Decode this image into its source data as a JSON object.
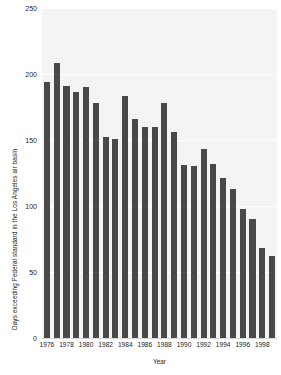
{
  "chart_data": {
    "type": "bar",
    "title": "",
    "xlabel": "Year",
    "ylabel": "Days exceeding Federal standard in the Los Angeles air basin",
    "ylim": [
      0,
      250
    ],
    "yticks": [
      0,
      50,
      100,
      150,
      200,
      250
    ],
    "ytick_labels": [
      "0",
      "50",
      "100",
      "150",
      "200",
      "250"
    ],
    "xticks": [
      1976,
      1978,
      1980,
      1982,
      1984,
      1986,
      1988,
      1990,
      1992,
      1994,
      1996,
      1998
    ],
    "xtick_labels": [
      "1976",
      "1978",
      "1980",
      "1982",
      "1984",
      "1986",
      "1988",
      "1990",
      "1992",
      "1994",
      "1996",
      "1998"
    ],
    "grid": "horizontal-white-on-gray",
    "legend": "none",
    "bar_color": "#494949",
    "plot_background": "#f4f4f4",
    "categories": [
      "1976",
      "1977",
      "1978",
      "1979",
      "1980",
      "1981",
      "1982",
      "1983",
      "1984",
      "1985",
      "1986",
      "1987",
      "1988",
      "1989",
      "1990",
      "1991",
      "1992",
      "1993",
      "1994",
      "1995",
      "1996",
      "1997",
      "1998",
      "1999"
    ],
    "values": [
      194,
      208,
      191,
      186,
      190,
      178,
      152,
      151,
      183,
      166,
      160,
      160,
      178,
      156,
      131,
      130,
      143,
      132,
      121,
      113,
      98,
      90,
      68,
      62
    ]
  },
  "axes": {
    "ylabel": "Days exceeding Federal standard in the Los Angeles air basin",
    "xlabel": "Year"
  }
}
